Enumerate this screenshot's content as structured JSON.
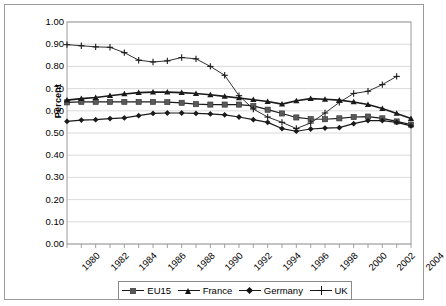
{
  "chart_data": {
    "type": "line",
    "title": "",
    "xlabel": "",
    "ylabel": "Percent",
    "ylim": [
      0.0,
      1.0
    ],
    "ytick_step": 0.1,
    "ytick_labels": [
      "1.00",
      "0.90",
      "0.80",
      "0.70",
      "0.60",
      "0.50",
      "0.40",
      "0.30",
      "0.20",
      "0.10",
      "0.00"
    ],
    "xlim": [
      1980,
      2004
    ],
    "x": [
      1980,
      1981,
      1982,
      1983,
      1984,
      1985,
      1986,
      1987,
      1988,
      1989,
      1990,
      1991,
      1992,
      1993,
      1994,
      1995,
      1996,
      1997,
      1998,
      1999,
      2000,
      2001,
      2002,
      2003,
      2004
    ],
    "xtick_labels": [
      "1980",
      "1982",
      "1984",
      "1986",
      "1988",
      "1990",
      "1992",
      "1994",
      "1996",
      "1998",
      "2000",
      "2002",
      "2004"
    ],
    "grid": "horizontal",
    "legend_position": "bottom",
    "series": [
      {
        "name": "EU15",
        "marker": "square",
        "values": [
          0.638,
          0.64,
          0.64,
          0.64,
          0.64,
          0.64,
          0.64,
          0.639,
          0.636,
          0.63,
          0.628,
          0.628,
          0.628,
          0.622,
          0.605,
          0.588,
          0.57,
          0.563,
          0.562,
          0.566,
          0.572,
          0.574,
          0.566,
          0.552,
          0.538
        ]
      },
      {
        "name": "France",
        "marker": "triangle",
        "values": [
          0.648,
          0.655,
          0.66,
          0.668,
          0.676,
          0.682,
          0.684,
          0.684,
          0.682,
          0.678,
          0.672,
          0.665,
          0.658,
          0.65,
          0.642,
          0.63,
          0.645,
          0.655,
          0.652,
          0.648,
          0.64,
          0.628,
          0.61,
          0.588,
          0.565
        ]
      },
      {
        "name": "Germany",
        "marker": "diamond",
        "values": [
          0.552,
          0.558,
          0.56,
          0.565,
          0.568,
          0.578,
          0.588,
          0.59,
          0.59,
          0.588,
          0.586,
          0.582,
          0.572,
          0.56,
          0.548,
          0.52,
          0.508,
          0.518,
          0.522,
          0.524,
          0.542,
          0.556,
          0.556,
          0.548,
          0.532
        ]
      },
      {
        "name": "UK",
        "marker": "plus",
        "values": [
          0.898,
          0.893,
          0.888,
          0.886,
          0.862,
          0.828,
          0.82,
          0.825,
          0.84,
          0.834,
          0.8,
          0.76,
          0.668,
          0.608,
          0.572,
          0.548,
          0.52,
          0.545,
          0.59,
          0.638,
          0.678,
          0.688,
          0.718,
          0.755,
          null
        ]
      }
    ]
  },
  "axis": {
    "ylabel": "Percent"
  },
  "legend": {
    "items": [
      {
        "label": "EU15"
      },
      {
        "label": "France"
      },
      {
        "label": "Germany"
      },
      {
        "label": "UK"
      }
    ]
  }
}
